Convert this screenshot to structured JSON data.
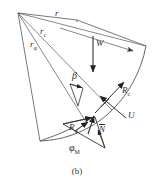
{
  "figure": {
    "caption": "(b)",
    "type": "log-spiral slope stability force diagram",
    "stroke_color": "#555555",
    "accent_color": "#2b2b2b",
    "background": "#ffffff"
  },
  "labels": {
    "r": {
      "base": "r",
      "sub": ""
    },
    "r_c": {
      "base": "r",
      "sub": "c"
    },
    "r_phi": {
      "base": "r",
      "sub": "φ"
    },
    "W": {
      "base": "W",
      "sub": ""
    },
    "beta": {
      "base": "β",
      "sub": ""
    },
    "R_c": {
      "base": "R",
      "sub": "c"
    },
    "U": {
      "base": "U",
      "sub": ""
    },
    "R_phi": {
      "base": "R",
      "sub": "φ"
    },
    "N_bar": {
      "base": "N",
      "sub": ""
    },
    "phi_M": {
      "base": "φ",
      "sub": "M"
    }
  }
}
